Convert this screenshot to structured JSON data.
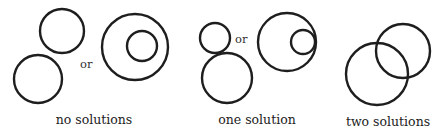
{
  "diagram": {
    "groups": [
      {
        "label": "no solutions",
        "connector": "or",
        "cases": [
          {
            "name": "separate",
            "circles": [
              {
                "cx": 62,
                "cy": 31,
                "r": 22
              },
              {
                "cx": 38,
                "cy": 79,
                "r": 24
              }
            ]
          },
          {
            "name": "nested",
            "circles": [
              {
                "cx": 135,
                "cy": 47,
                "r": 33
              },
              {
                "cx": 142,
                "cy": 46,
                "r": 15
              }
            ]
          }
        ]
      },
      {
        "label": "one solution",
        "connector": "or",
        "cases": [
          {
            "name": "externally-tangent",
            "circles": [
              {
                "cx": 215,
                "cy": 38,
                "r": 15
              },
              {
                "cx": 227,
                "cy": 78,
                "r": 25
              }
            ]
          },
          {
            "name": "internally-tangent",
            "circles": [
              {
                "cx": 287,
                "cy": 42,
                "r": 29
              },
              {
                "cx": 303,
                "cy": 42,
                "r": 12
              }
            ]
          }
        ]
      },
      {
        "label": "two solutions",
        "cases": [
          {
            "name": "intersecting",
            "circles": [
              {
                "cx": 377,
                "cy": 74,
                "r": 31
              },
              {
                "cx": 403,
                "cy": 51,
                "r": 27
              }
            ]
          }
        ]
      }
    ],
    "colors": {
      "stroke": "#1e1e1e",
      "text": "#222222",
      "background": "#ffffff"
    }
  }
}
